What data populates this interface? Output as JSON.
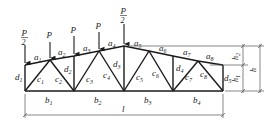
{
  "diagram": {
    "type": "roof-truss",
    "colors": {
      "line": "#1a1a1a",
      "dim": "#555555",
      "bg": "#ffffff"
    },
    "loads": [
      {
        "label": "P/2",
        "num": "P",
        "den": "2",
        "x": 25
      },
      {
        "label": "P",
        "x": 50
      },
      {
        "label": "P",
        "x": 74
      },
      {
        "label": "P",
        "x": 99
      },
      {
        "label": "P/2",
        "num": "P",
        "den": "2",
        "x": 124
      }
    ],
    "top_chord": [
      "a1",
      "a2",
      "a3",
      "a4",
      "a5",
      "a6",
      "a7",
      "a8"
    ],
    "bottom_chord": [
      "b1",
      "b2",
      "b3",
      "b4"
    ],
    "diagonals": [
      "c1",
      "c2",
      "c3",
      "c4",
      "c5",
      "c6",
      "c7",
      "c8"
    ],
    "verticals": [
      "d1",
      "d2",
      "d3",
      "d4",
      "d5"
    ],
    "dimensions": {
      "span": "l",
      "height": "h",
      "h1": "h1",
      "h2": "h2"
    },
    "labels": {
      "a1": {
        "base": "a",
        "sub": "1"
      },
      "a2": {
        "base": "a",
        "sub": "2"
      },
      "a3": {
        "base": "a",
        "sub": "3"
      },
      "a4": {
        "base": "a",
        "sub": "4"
      },
      "a5": {
        "base": "a",
        "sub": "5"
      },
      "a6": {
        "base": "a",
        "sub": "6"
      },
      "a7": {
        "base": "a",
        "sub": "7"
      },
      "a8": {
        "base": "a",
        "sub": "8"
      },
      "b1": {
        "base": "b",
        "sub": "1"
      },
      "b2": {
        "base": "b",
        "sub": "2"
      },
      "b3": {
        "base": "b",
        "sub": "3"
      },
      "b4": {
        "base": "b",
        "sub": "4"
      },
      "c1": {
        "base": "c",
        "sub": "1"
      },
      "c2": {
        "base": "c",
        "sub": "2"
      },
      "c3": {
        "base": "c",
        "sub": "3"
      },
      "c4": {
        "base": "c",
        "sub": "4"
      },
      "c5": {
        "base": "c",
        "sub": "5"
      },
      "c6": {
        "base": "c",
        "sub": "6"
      },
      "c7": {
        "base": "c",
        "sub": "7"
      },
      "c8": {
        "base": "c",
        "sub": "8"
      },
      "d1": {
        "base": "d",
        "sub": "1"
      },
      "d2": {
        "base": "d",
        "sub": "2"
      },
      "d3": {
        "base": "d",
        "sub": "3"
      },
      "d4": {
        "base": "d",
        "sub": "4"
      },
      "d5": {
        "base": "d",
        "sub": "5"
      },
      "l": "l",
      "h": "h",
      "h1": {
        "base": "h",
        "sub": "1"
      },
      "h2": {
        "base": "h",
        "sub": "2"
      },
      "P": "P",
      "two": "2"
    }
  }
}
